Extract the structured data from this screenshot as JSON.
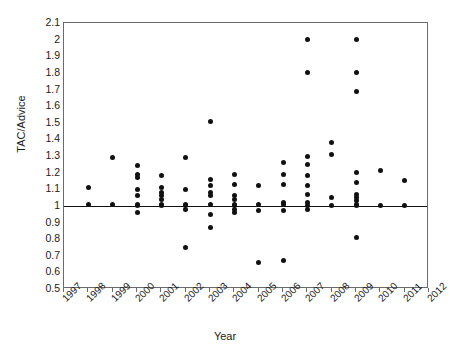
{
  "chart_data": {
    "type": "scatter",
    "title": "",
    "xlabel": "Year",
    "ylabel": "TAC/Advice",
    "xlim": [
      1997,
      2012
    ],
    "ylim": [
      0.5,
      2.1
    ],
    "ytick_step": 0.1,
    "grid": false,
    "legend": "none",
    "reference_line": {
      "orientation": "horizontal",
      "value": 1.0
    },
    "xticks": [
      "1997",
      "1998",
      "1999",
      "2000",
      "2001",
      "2002",
      "2003",
      "2004",
      "2005",
      "2006",
      "2007",
      "2008",
      "2009",
      "2010",
      "2011",
      "2012"
    ],
    "yticks": [
      "0.5",
      "0.6",
      "0.7",
      "0.8",
      "0.9",
      "1",
      "1.1",
      "1.2",
      "1.3",
      "1.4",
      "1.5",
      "1.6",
      "1.7",
      "1.8",
      "1.9",
      "2",
      "2.1"
    ],
    "series": [
      {
        "name": "TAC/Advice ratio",
        "points": [
          {
            "x": 1998,
            "y": 1.11
          },
          {
            "x": 1998,
            "y": 1.01
          },
          {
            "x": 1999,
            "y": 1.29
          },
          {
            "x": 1999,
            "y": 1.01
          },
          {
            "x": 2000,
            "y": 1.24
          },
          {
            "x": 2000,
            "y": 1.19
          },
          {
            "x": 2000,
            "y": 1.17
          },
          {
            "x": 2000,
            "y": 1.1
          },
          {
            "x": 2000,
            "y": 1.06
          },
          {
            "x": 2000,
            "y": 1.01
          },
          {
            "x": 2000,
            "y": 1.0
          },
          {
            "x": 2000,
            "y": 0.96
          },
          {
            "x": 2001,
            "y": 1.18
          },
          {
            "x": 2001,
            "y": 1.11
          },
          {
            "x": 2001,
            "y": 1.08
          },
          {
            "x": 2001,
            "y": 1.06
          },
          {
            "x": 2001,
            "y": 1.04
          },
          {
            "x": 2001,
            "y": 1.01
          },
          {
            "x": 2001,
            "y": 1.0
          },
          {
            "x": 2002,
            "y": 1.29
          },
          {
            "x": 2002,
            "y": 1.1
          },
          {
            "x": 2002,
            "y": 1.01
          },
          {
            "x": 2002,
            "y": 1.0
          },
          {
            "x": 2002,
            "y": 0.98
          },
          {
            "x": 2002,
            "y": 0.75
          },
          {
            "x": 2003,
            "y": 1.51
          },
          {
            "x": 2003,
            "y": 1.16
          },
          {
            "x": 2003,
            "y": 1.12
          },
          {
            "x": 2003,
            "y": 1.08
          },
          {
            "x": 2003,
            "y": 1.06
          },
          {
            "x": 2003,
            "y": 1.01
          },
          {
            "x": 2003,
            "y": 0.95
          },
          {
            "x": 2003,
            "y": 0.87
          },
          {
            "x": 2004,
            "y": 1.19
          },
          {
            "x": 2004,
            "y": 1.13
          },
          {
            "x": 2004,
            "y": 1.06
          },
          {
            "x": 2004,
            "y": 1.04
          },
          {
            "x": 2004,
            "y": 1.01
          },
          {
            "x": 2004,
            "y": 1.0
          },
          {
            "x": 2004,
            "y": 0.98
          },
          {
            "x": 2004,
            "y": 0.96
          },
          {
            "x": 2005,
            "y": 1.12
          },
          {
            "x": 2005,
            "y": 1.01
          },
          {
            "x": 2005,
            "y": 0.97
          },
          {
            "x": 2005,
            "y": 0.66
          },
          {
            "x": 2006,
            "y": 1.26
          },
          {
            "x": 2006,
            "y": 1.19
          },
          {
            "x": 2006,
            "y": 1.13
          },
          {
            "x": 2006,
            "y": 1.02
          },
          {
            "x": 2006,
            "y": 1.01
          },
          {
            "x": 2006,
            "y": 0.97
          },
          {
            "x": 2006,
            "y": 0.67
          },
          {
            "x": 2007,
            "y": 2.0
          },
          {
            "x": 2007,
            "y": 1.8
          },
          {
            "x": 2007,
            "y": 1.3
          },
          {
            "x": 2007,
            "y": 1.25
          },
          {
            "x": 2007,
            "y": 1.18
          },
          {
            "x": 2007,
            "y": 1.12
          },
          {
            "x": 2007,
            "y": 1.07
          },
          {
            "x": 2007,
            "y": 1.02
          },
          {
            "x": 2007,
            "y": 1.0
          },
          {
            "x": 2007,
            "y": 0.98
          },
          {
            "x": 2008,
            "y": 1.38
          },
          {
            "x": 2008,
            "y": 1.31
          },
          {
            "x": 2008,
            "y": 1.05
          },
          {
            "x": 2008,
            "y": 1.0
          },
          {
            "x": 2009,
            "y": 2.0
          },
          {
            "x": 2009,
            "y": 1.8
          },
          {
            "x": 2009,
            "y": 1.69
          },
          {
            "x": 2009,
            "y": 1.2
          },
          {
            "x": 2009,
            "y": 1.14
          },
          {
            "x": 2009,
            "y": 1.07
          },
          {
            "x": 2009,
            "y": 1.05
          },
          {
            "x": 2009,
            "y": 1.03
          },
          {
            "x": 2009,
            "y": 1.01
          },
          {
            "x": 2009,
            "y": 1.0
          },
          {
            "x": 2009,
            "y": 0.81
          },
          {
            "x": 2010,
            "y": 1.21
          },
          {
            "x": 2010,
            "y": 1.0
          },
          {
            "x": 2011,
            "y": 1.15
          },
          {
            "x": 2011,
            "y": 1.0
          }
        ]
      }
    ]
  }
}
